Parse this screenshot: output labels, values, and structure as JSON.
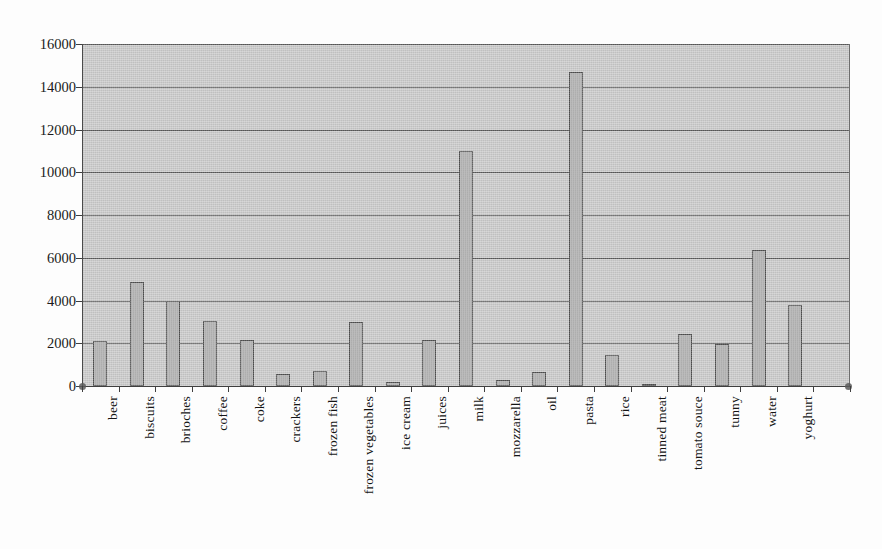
{
  "chart": {
    "title": "",
    "type_label": "bar-chart"
  },
  "chart_data": {
    "type": "bar",
    "title": "",
    "xlabel": "",
    "ylabel": "",
    "ylim": [
      0,
      16000
    ],
    "ytick_step": 2000,
    "grid": "horizontal",
    "legend": "none",
    "orientation": "vertical",
    "bar_color": "#ababab",
    "bar_border_color": "#4f4f4f",
    "plot_background": "#c9c9c9",
    "categories": [
      "beer",
      "biscuits",
      "brioches",
      "coffee",
      "coke",
      "crackers",
      "frozen fish",
      "frozen vegetables",
      "ice cream",
      "juices",
      "milk",
      "mozzarella",
      "oil",
      "pasta",
      "rice",
      "tinned meat",
      "tomato souce",
      "tunny",
      "water",
      "yoghurt"
    ],
    "values": [
      2100,
      4850,
      4000,
      3050,
      2150,
      550,
      680,
      3000,
      200,
      2150,
      11000,
      300,
      650,
      14700,
      1450,
      100,
      2450,
      1980,
      6350,
      3800
    ],
    "ytick_labels": [
      "0",
      "2000",
      "4000",
      "6000",
      "8000",
      "10000",
      "12000",
      "14000",
      "16000"
    ],
    "ytick_values": [
      0,
      2000,
      4000,
      6000,
      8000,
      10000,
      12000,
      14000,
      16000
    ]
  }
}
